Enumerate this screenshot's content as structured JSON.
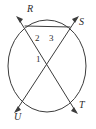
{
  "figure": {
    "kind": "circle-with-two-intersecting-secants",
    "background_color": "#ffffff",
    "stroke_color": "#3c3c3c",
    "label_color": "#2b2b2b"
  },
  "circle": {
    "name": "main-circle",
    "cx": 47,
    "cy": 66,
    "rx": 39,
    "ry": 46
  },
  "intersection": {
    "name": "chord-intersection-point",
    "x": 50,
    "y": 66
  },
  "points": [
    {
      "id": "R",
      "label": "R",
      "on_circle_x": 25,
      "on_circle_y": 26,
      "label_x": 27,
      "label_y": 8,
      "arrow_tip_x": 16,
      "arrow_tip_y": 16
    },
    {
      "id": "S",
      "label": "S",
      "on_circle_x": 70,
      "on_circle_y": 27,
      "label_x": 79,
      "label_y": 21,
      "arrow_tip_x": 79,
      "arrow_tip_y": 16
    },
    {
      "id": "U",
      "label": "U",
      "on_circle_x": 25,
      "on_circle_y": 103,
      "label_x": 15,
      "label_y": 113,
      "arrow_tip_x": 14,
      "arrow_tip_y": 112
    },
    {
      "id": "T",
      "label": "T",
      "on_circle_x": 70,
      "on_circle_y": 103,
      "label_x": 79,
      "label_y": 104,
      "arrow_tip_x": 78,
      "arrow_tip_y": 114
    }
  ],
  "segments": [
    {
      "name": "secant-R-T",
      "from": "R",
      "to": "T"
    },
    {
      "name": "secant-S-U",
      "from": "S",
      "to": "U"
    },
    {
      "name": "chord-R-S",
      "from": "R",
      "to": "S"
    }
  ],
  "angles": [
    {
      "id": "1",
      "label": "1",
      "x": 37,
      "y": 56,
      "description": "angle left of intersection"
    },
    {
      "id": "2",
      "label": "2",
      "x": 36,
      "y": 35,
      "description": "angle upper-left below chord RS"
    },
    {
      "id": "3",
      "label": "3",
      "x": 50,
      "y": 34,
      "description": "angle upper-right below chord RS"
    }
  ]
}
